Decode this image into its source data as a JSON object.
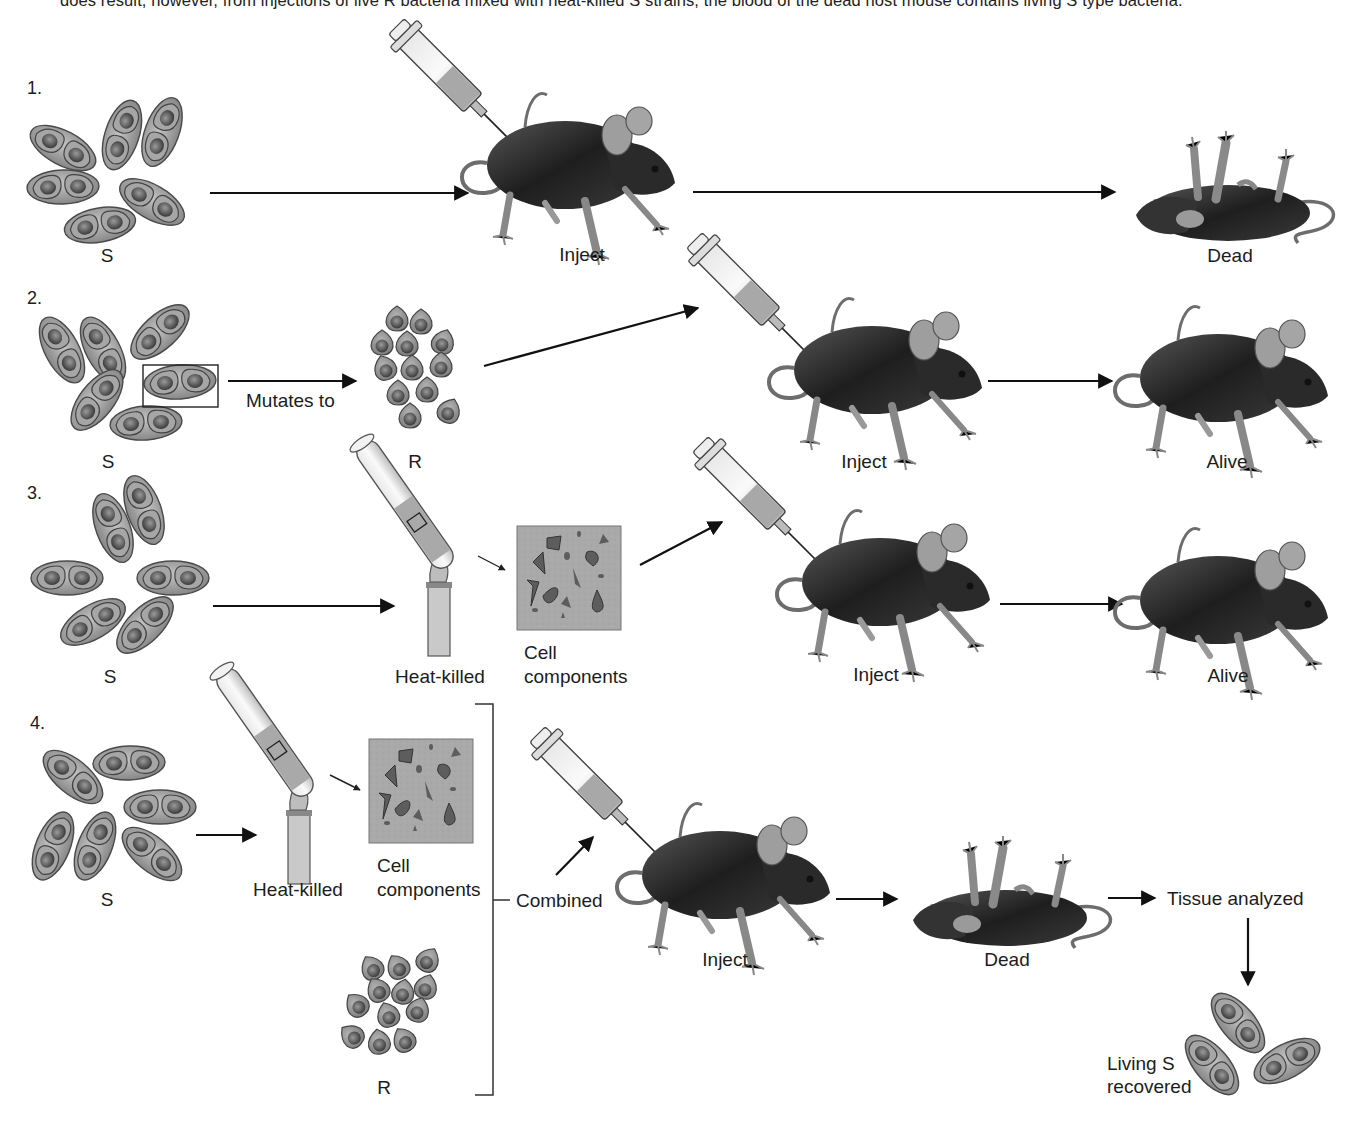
{
  "header_text": "does result, however, from injections of live R bacteria mixed with heat-killed S strains; the blood of the dead host mouse contains living S type bacteria.",
  "experiments": [
    {
      "number": "1.",
      "strain_label": "S",
      "inject_label": "Inject",
      "outcome_label": "Dead"
    },
    {
      "number": "2.",
      "strain_label": "S",
      "mutation_label": "Mutates to",
      "mutant_label": "R",
      "inject_label": "Inject",
      "outcome_label": "Alive"
    },
    {
      "number": "3.",
      "strain_label": "S",
      "heat_label": "Heat-killed",
      "components_label_line1": "Cell",
      "components_label_line2": "components",
      "inject_label": "Inject",
      "outcome_label": "Alive"
    },
    {
      "number": "4.",
      "strain_label": "S",
      "heat_label": "Heat-killed",
      "components_label_line1": "Cell",
      "components_label_line2": "components",
      "mutant_label": "R",
      "combined_label": "Combined",
      "inject_label": "Inject",
      "outcome_label": "Dead",
      "analysis_label": "Tissue analyzed",
      "recovered_label_line1": "Living S",
      "recovered_label_line2": "recovered"
    }
  ],
  "colors": {
    "cell_fill": "#9a9a9a",
    "cell_inner": "#6e6e6e",
    "mouse_body": "#2b2b2b",
    "components_bg": "#a8a8a8",
    "arrow": "#111111"
  }
}
